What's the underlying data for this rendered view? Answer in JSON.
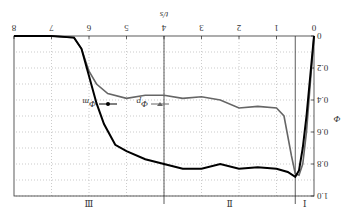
{
  "chart_data": {
    "type": "line",
    "title": "",
    "xlabel": "t/s",
    "ylabel": "Φ",
    "xlim": [
      0,
      8
    ],
    "ylim": [
      0,
      1.0
    ],
    "xticks": [
      "0",
      "1",
      "2",
      "3",
      "4",
      "5",
      "6",
      "7",
      "8"
    ],
    "yticks": [
      "0",
      "0.2",
      "0.4",
      "0.6",
      "0.8",
      "1.0"
    ],
    "grid": true,
    "orientation_note": "figure rendered rotated 180 degrees",
    "regions": [
      {
        "label": "I",
        "from": 0,
        "to": 0.5
      },
      {
        "label": "II",
        "from": 0.5,
        "to": 4
      },
      {
        "label": "III",
        "from": 4,
        "to": 8
      }
    ],
    "legend": [
      {
        "name": "Φp",
        "base": "Φ",
        "sub": "p",
        "marker": "triangle-down",
        "color": "#666666"
      },
      {
        "name": "Φm",
        "base": "Φ",
        "sub": "m",
        "marker": "circle",
        "color": "#000000"
      }
    ],
    "series": [
      {
        "name": "Φp",
        "color": "#666666",
        "x": [
          0,
          0.1,
          0.2,
          0.3,
          0.4,
          0.5,
          0.6,
          0.8,
          1.0,
          1.5,
          2.0,
          2.5,
          3.0,
          3.5,
          4.0,
          4.5,
          5.0,
          5.5,
          5.8,
          6.0,
          6.2,
          6.4,
          7.0,
          8.0
        ],
        "y": [
          0,
          0.3,
          0.6,
          0.8,
          0.87,
          0.86,
          0.75,
          0.5,
          0.45,
          0.44,
          0.45,
          0.4,
          0.38,
          0.39,
          0.37,
          0.37,
          0.39,
          0.36,
          0.3,
          0.22,
          0.08,
          0.01,
          0,
          0
        ]
      },
      {
        "name": "Φm",
        "color": "#000000",
        "x": [
          0,
          0.2,
          0.3,
          0.4,
          0.5,
          0.7,
          1.0,
          1.5,
          2.0,
          2.5,
          3.0,
          3.5,
          4.0,
          4.5,
          5.0,
          5.3,
          5.6,
          5.8,
          6.0,
          6.2,
          6.4,
          7.0,
          8.0
        ],
        "y": [
          0,
          0.5,
          0.7,
          0.84,
          0.88,
          0.85,
          0.83,
          0.82,
          0.83,
          0.8,
          0.83,
          0.83,
          0.8,
          0.77,
          0.72,
          0.68,
          0.55,
          0.42,
          0.25,
          0.08,
          0.01,
          0,
          0
        ]
      }
    ]
  }
}
